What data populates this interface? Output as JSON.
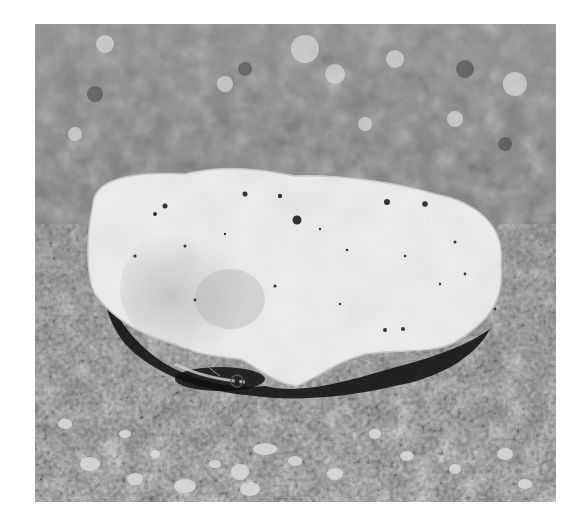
{
  "image": {
    "description": "Grayscale photograph of a crab hiding beneath a pale shell fragment resting on coarse sand",
    "subject": "crab carrying shell on sand",
    "colors": {
      "background": "#ffffff",
      "sand_dark": "#5a5a5a",
      "sand_mid": "#8c8c8c",
      "sand_light": "#c8c8c8",
      "shell": "#ebebeb",
      "shadow": "#1a1a1a"
    }
  }
}
